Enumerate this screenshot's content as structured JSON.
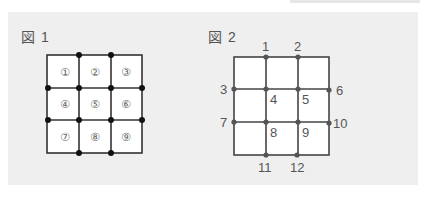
{
  "figure1": {
    "label": "図 1",
    "cells": [
      "①",
      "②",
      "③",
      "④",
      "⑤",
      "⑥",
      "⑦",
      "⑧",
      "⑨"
    ],
    "dot_color": "#111111",
    "line_color": "#333333"
  },
  "figure2": {
    "label": "図 2",
    "points": {
      "p1": "1",
      "p2": "2",
      "p3": "3",
      "p4": "4",
      "p5": "5",
      "p6": "6",
      "p7": "7",
      "p8": "8",
      "p9": "9",
      "p10": "10",
      "p11": "11",
      "p12": "12"
    },
    "dot_color": "#555555",
    "line_color": "#444444"
  },
  "colors": {
    "panel_bg": "#efefef",
    "cell_bg": "#ffffff",
    "text": "#555555"
  }
}
